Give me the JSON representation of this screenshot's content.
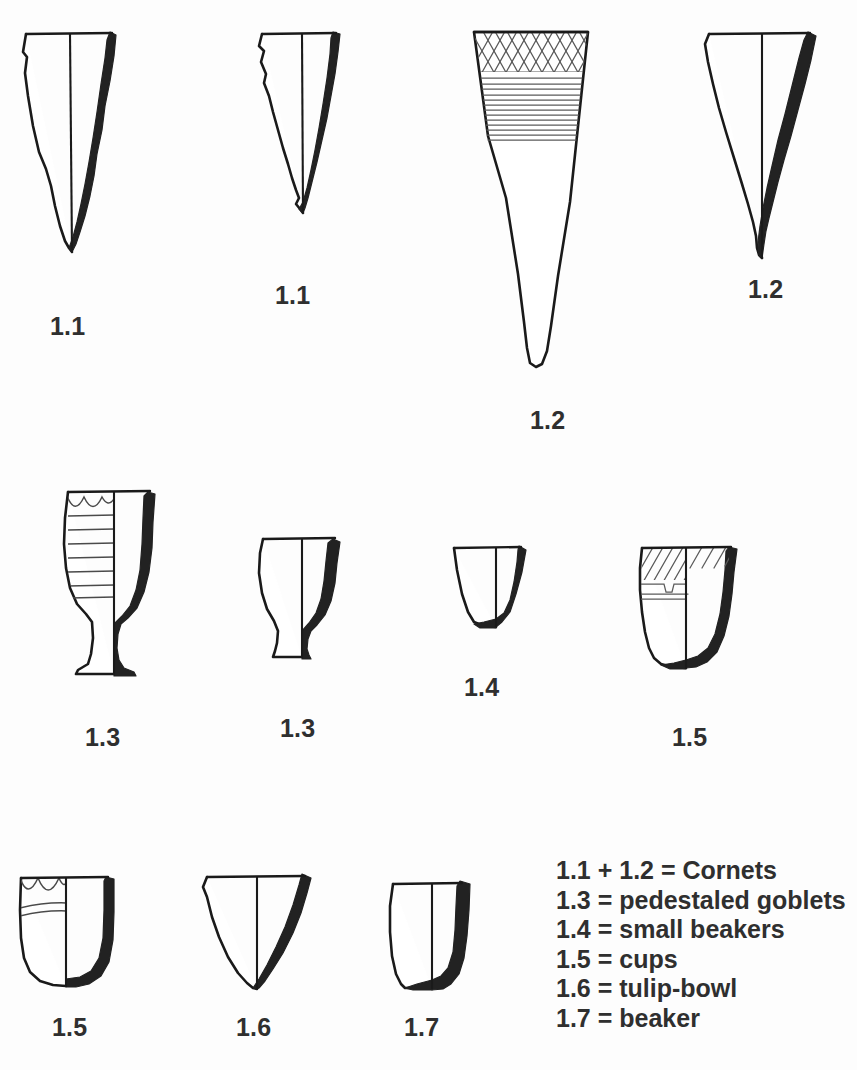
{
  "plate": {
    "title": "Pottery typology plate",
    "background_color": "#fdfdfd",
    "ink_color": "#1a1a1a",
    "section_fill_color": "#222222",
    "label_color": "#2f2f2f"
  },
  "figures": [
    {
      "id": "fig-1-1-large",
      "label": "1.1",
      "type": "cornet",
      "row": 1,
      "decorated": false
    },
    {
      "id": "fig-1-1-small",
      "label": "1.1",
      "type": "cornet",
      "row": 1,
      "decorated": false
    },
    {
      "id": "fig-1-2-large",
      "label": "1.2",
      "type": "cornet",
      "row": 1,
      "decorated": true
    },
    {
      "id": "fig-1-2-right",
      "label": "1.2",
      "type": "cornet",
      "row": 1,
      "decorated": false
    },
    {
      "id": "fig-1-3-tall",
      "label": "1.3",
      "type": "pedestaled goblet",
      "row": 2,
      "decorated": true
    },
    {
      "id": "fig-1-3-short",
      "label": "1.3",
      "type": "pedestaled goblet",
      "row": 2,
      "decorated": false
    },
    {
      "id": "fig-1-4",
      "label": "1.4",
      "type": "small beaker",
      "row": 2,
      "decorated": false
    },
    {
      "id": "fig-1-5-flat",
      "label": "1.5",
      "type": "cup",
      "row": 2,
      "decorated": true
    },
    {
      "id": "fig-1-5-round",
      "label": "1.5",
      "type": "cup",
      "row": 3,
      "decorated": true
    },
    {
      "id": "fig-1-6",
      "label": "1.6",
      "type": "tulip-bowl",
      "row": 3,
      "decorated": false
    },
    {
      "id": "fig-1-7",
      "label": "1.7",
      "type": "beaker",
      "row": 3,
      "decorated": false
    }
  ],
  "legend": {
    "entries": [
      "1.1 + 1.2 = Cornets",
      "1.3 = pedestaled goblets",
      "1.4 = small beakers",
      "1.5 = cups",
      "1.6 = tulip-bowl",
      "1.7 = beaker"
    ]
  }
}
